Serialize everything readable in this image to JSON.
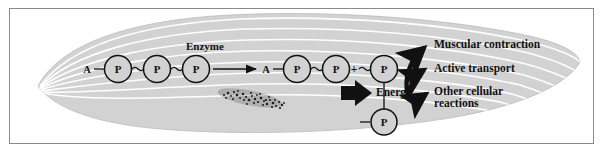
{
  "figure": {
    "cell_type": "muscle fiber",
    "frame_color": "#8a8a8a",
    "cell_fill": "#d2d2d2",
    "striation_color": "#ffffff",
    "ink_color": "#111111"
  },
  "labels": {
    "enzyme": "Enzyme",
    "energy": "Energy",
    "output_1": "Muscular contraction",
    "output_2": "Active transport",
    "output_3_line1": "Other cellular",
    "output_3_line2": "reactions"
  },
  "reactants": {
    "adenosine": "A",
    "phosphate": "P",
    "plus": "+",
    "left_chain": [
      "A",
      "P",
      "P",
      "P"
    ],
    "right_chain": [
      "A",
      "P",
      "P"
    ],
    "free_phosphate": "P",
    "released_phosphate": "P"
  },
  "structures": {
    "nucleus_label": "nucleus",
    "block_arrow_label": "energy-release-arrow"
  }
}
